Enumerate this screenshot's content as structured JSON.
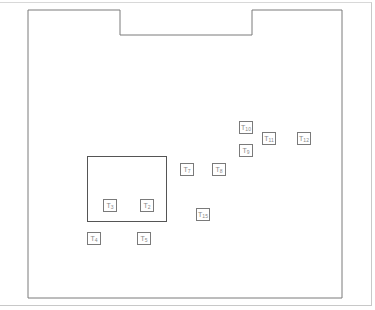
{
  "diagram": {
    "board_outline": {
      "points": "28,10 120,10 120,35 252,35 252,10 342,10 342,298 28,298",
      "stroke": "#7a7a7a"
    },
    "inner_rect": {
      "x": 87,
      "y": 156,
      "w": 79,
      "h": 65
    },
    "terminals": [
      {
        "id": "T1",
        "prefix": "T",
        "sub": "10",
        "x": 239,
        "y": 121
      },
      {
        "id": "T2",
        "prefix": "T",
        "sub": "9",
        "x": 239,
        "y": 144
      },
      {
        "id": "T3",
        "prefix": "T",
        "sub": "11",
        "x": 262,
        "y": 132
      },
      {
        "id": "T4",
        "prefix": "T",
        "sub": "12",
        "x": 297,
        "y": 132
      },
      {
        "id": "T5",
        "prefix": "T",
        "sub": "7",
        "x": 180,
        "y": 163
      },
      {
        "id": "T6",
        "prefix": "T",
        "sub": "8",
        "x": 212,
        "y": 163
      },
      {
        "id": "T7",
        "prefix": "T",
        "sub": "3",
        "x": 103,
        "y": 199
      },
      {
        "id": "T8",
        "prefix": "T",
        "sub": "2",
        "x": 140,
        "y": 199
      },
      {
        "id": "T9",
        "prefix": "T",
        "sub": "15",
        "x": 196,
        "y": 208
      },
      {
        "id": "T10",
        "prefix": "T",
        "sub": "4",
        "x": 87,
        "y": 232
      },
      {
        "id": "T11",
        "prefix": "T",
        "sub": "5",
        "x": 137,
        "y": 232
      }
    ]
  }
}
